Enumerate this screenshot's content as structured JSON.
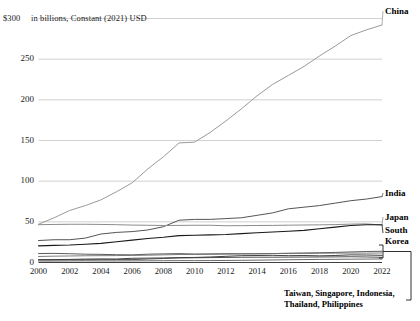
{
  "chart_data": {
    "type": "line",
    "title": "",
    "subtitle": "",
    "unit_note": "in billions, Constant (2021) USD",
    "xlabel": "",
    "ylabel": "",
    "xlim": [
      2000,
      2022
    ],
    "ylim": [
      0,
      300
    ],
    "grid": true,
    "legend_position": "right-inline",
    "y_axis_top_label": "$300",
    "y_ticks": [
      0,
      50,
      100,
      150,
      200,
      250,
      300
    ],
    "y_tick_labels": [
      "0",
      "50",
      "100",
      "150",
      "200",
      "250",
      "$300"
    ],
    "x_ticks": [
      2000,
      2002,
      2004,
      2006,
      2008,
      2010,
      2012,
      2014,
      2016,
      2018,
      2020,
      2022
    ],
    "x_tick_labels": [
      "2000",
      "2002",
      "2004",
      "2006",
      "2008",
      "2010",
      "2012",
      "2014",
      "2016",
      "2018",
      "2020",
      "2022"
    ],
    "x": [
      2000,
      2001,
      2002,
      2003,
      2004,
      2005,
      2006,
      2007,
      2008,
      2009,
      2010,
      2011,
      2012,
      2013,
      2014,
      2015,
      2016,
      2017,
      2018,
      2019,
      2020,
      2021,
      2022
    ],
    "series": [
      {
        "name": "China",
        "color": "#9a9a9a",
        "width": 1.0,
        "label_x": 2022,
        "values": [
          47,
          55,
          64,
          70,
          77,
          87,
          98,
          115,
          130,
          147,
          148,
          160,
          174,
          189,
          205,
          219,
          230,
          241,
          254,
          266,
          279,
          286,
          292
        ]
      },
      {
        "name": "India",
        "color": "#555555",
        "width": 1.0,
        "label_x": 2022,
        "values": [
          27,
          28,
          28,
          30,
          35,
          37,
          38,
          40,
          44,
          52,
          53,
          53,
          54,
          55,
          58,
          61,
          66,
          68,
          70,
          73,
          76,
          78,
          81
        ]
      },
      {
        "name": "Japan",
        "color": "#8c8c8c",
        "width": 1.0,
        "label_x": 2022,
        "values": [
          46.5,
          46.8,
          47.0,
          47.0,
          46.8,
          46.5,
          46.0,
          45.8,
          45.5,
          45.6,
          45.8,
          45.8,
          45.2,
          45.3,
          45.5,
          45.6,
          45.9,
          46.1,
          46.3,
          46.6,
          47.2,
          47.5,
          46.0
        ]
      },
      {
        "name": "South Korea",
        "color": "#1a1a1a",
        "width": 1.1,
        "label_x": 2022,
        "values": [
          20.5,
          21.0,
          21.5,
          22.5,
          23.5,
          25.5,
          27.5,
          29.5,
          31.0,
          33.0,
          33.5,
          34.0,
          34.5,
          35.5,
          36.5,
          37.5,
          38.5,
          39.5,
          41.5,
          43.5,
          45.5,
          46.5,
          46.4
        ]
      },
      {
        "name": "Taiwan",
        "color": "#4a4a4a",
        "width": 0.9,
        "label_x": null,
        "values": [
          11.0,
          11.2,
          10.8,
          10.2,
          10.0,
          9.6,
          9.4,
          10.2,
          10.6,
          10.9,
          10.4,
          10.6,
          10.8,
          10.8,
          10.8,
          11.0,
          11.3,
          11.6,
          12.0,
          12.4,
          13.0,
          13.5,
          13.8
        ]
      },
      {
        "name": "Singapore",
        "color": "#6e6e6e",
        "width": 0.9,
        "label_x": null,
        "values": [
          7.4,
          7.8,
          8.0,
          8.3,
          8.4,
          8.5,
          8.7,
          9.0,
          9.4,
          9.8,
          9.9,
          10.1,
          10.3,
          10.5,
          10.7,
          11.0,
          11.2,
          11.3,
          11.4,
          11.5,
          11.6,
          11.5,
          11.7
        ]
      },
      {
        "name": "Indonesia",
        "color": "#2b2b2b",
        "width": 0.9,
        "label_x": null,
        "values": [
          3.4,
          3.6,
          3.8,
          4.2,
          4.4,
          4.3,
          5.2,
          5.4,
          5.6,
          6.0,
          6.2,
          6.8,
          7.6,
          8.4,
          8.6,
          8.8,
          8.4,
          8.6,
          8.2,
          8.6,
          9.4,
          9.2,
          8.8
        ]
      },
      {
        "name": "Thailand",
        "color": "#3d3d3d",
        "width": 0.9,
        "label_x": null,
        "values": [
          3.2,
          3.2,
          3.3,
          3.3,
          3.4,
          3.5,
          3.6,
          4.3,
          4.9,
          5.6,
          5.8,
          6.0,
          6.2,
          6.4,
          6.5,
          6.5,
          6.6,
          6.7,
          6.8,
          6.9,
          7.1,
          6.8,
          6.4
        ]
      },
      {
        "name": "Philippines",
        "color": "#5a5a5a",
        "width": 0.9,
        "label_x": null,
        "values": [
          1.8,
          1.8,
          1.9,
          2.0,
          1.9,
          1.9,
          2.0,
          2.1,
          2.2,
          2.3,
          2.3,
          2.4,
          2.5,
          2.7,
          2.9,
          3.1,
          3.4,
          3.6,
          3.8,
          3.9,
          4.1,
          4.2,
          4.3
        ]
      }
    ],
    "grouped_label": "Taiwan, Singapore, Indonesia,\nThailand, Philippines",
    "grouped_label_line1": "Taiwan, Singapore, Indonesia,",
    "grouped_label_line2": "Thailand, Philippines",
    "grouped_members": [
      "Taiwan",
      "Singapore",
      "Indonesia",
      "Thailand",
      "Philippines"
    ]
  },
  "labels": {
    "china": "China",
    "india": "India",
    "japan": "Japan",
    "south_korea_line1": "South",
    "south_korea_line2": "Korea"
  }
}
